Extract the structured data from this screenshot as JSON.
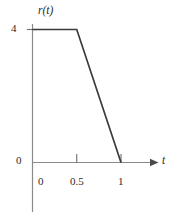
{
  "figure": {
    "name": "piecewise-rate-function-plot",
    "background_color": "#ffffff"
  },
  "axes": {
    "y_axis_label": "r(t)",
    "x_axis_label": "t",
    "axis_color": "#8a8a8a",
    "curve_color": "#3b3b3b",
    "text_color": "#2b2b2b",
    "y_ticks": [
      {
        "value": 4,
        "label": "4"
      },
      {
        "value": 0,
        "label": "0"
      }
    ],
    "x_ticks": [
      {
        "value": 0,
        "label": "0"
      },
      {
        "value": 0.5,
        "label": "0.5"
      },
      {
        "value": 1,
        "label": "1"
      }
    ]
  },
  "chart_data": {
    "type": "line",
    "title": "",
    "xlabel": "t",
    "ylabel": "r(t)",
    "xlim": [
      0,
      1.25
    ],
    "ylim": [
      0,
      4.4
    ],
    "grid": false,
    "legend": null,
    "xticks": [
      0,
      0.5,
      1
    ],
    "xticklabels": [
      "0",
      "0.5",
      "1"
    ],
    "yticks": [
      0,
      4
    ],
    "yticklabels": [
      "0",
      "4"
    ],
    "series": [
      {
        "name": "r(t)",
        "color": "#3b3b3b",
        "x": [
          0,
          0.5,
          1
        ],
        "y": [
          4,
          4,
          0
        ],
        "description": "Constant at 4 from t=0 to t=0.5, then decreases linearly to 0 at t=1"
      }
    ],
    "annotations": []
  }
}
